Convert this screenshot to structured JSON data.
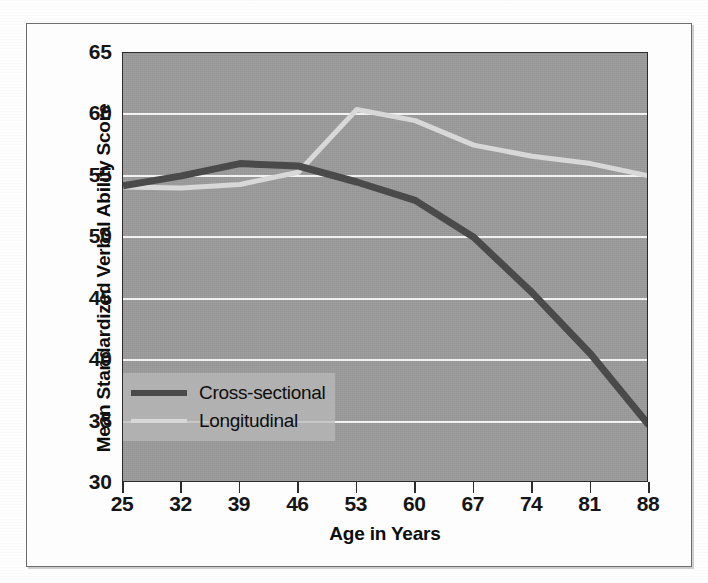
{
  "figure": {
    "frame_visible": true
  },
  "chart_data": {
    "type": "line",
    "title": "",
    "xlabel": "Age in Years",
    "ylabel": "Mean Standardized Verbal Ability Score",
    "x": [
      25,
      32,
      39,
      46,
      53,
      60,
      67,
      74,
      81,
      88
    ],
    "xtick_labels": [
      "25",
      "32",
      "39",
      "46",
      "53",
      "60",
      "67",
      "74",
      "81",
      "88"
    ],
    "ytick_labels": [
      "30",
      "35",
      "40",
      "45",
      "50",
      "55",
      "60",
      "65"
    ],
    "yticks": [
      30,
      35,
      40,
      45,
      50,
      55,
      60,
      65
    ],
    "xlim": [
      25,
      88
    ],
    "ylim": [
      30,
      65
    ],
    "grid": true,
    "grid_color": "#f2f2f2",
    "plot_background": "#9c9c9c",
    "legend_position": "lower-left-inside",
    "series": [
      {
        "name": "Cross-sectional",
        "color": "#4a4a4a",
        "width": 7,
        "values": [
          54.2,
          55.0,
          56.0,
          55.8,
          54.5,
          53.0,
          50.0,
          45.5,
          40.5,
          34.7
        ]
      },
      {
        "name": "Longitudinal",
        "color": "#d8d8d8",
        "width": 5,
        "values": [
          54.1,
          54.0,
          54.3,
          55.3,
          60.4,
          59.5,
          57.5,
          56.6,
          56.0,
          55.0
        ]
      }
    ]
  }
}
